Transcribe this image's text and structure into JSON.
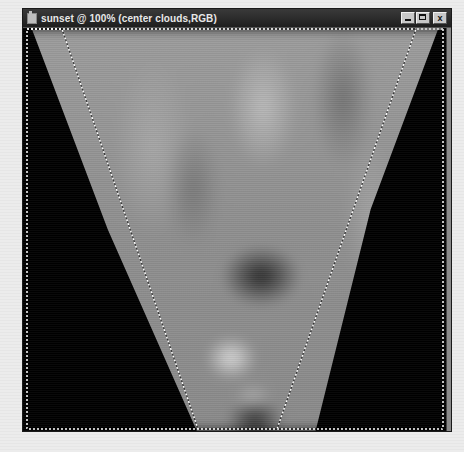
{
  "window": {
    "title": "sunset @ 100% (center clouds,RGB)",
    "document_name": "sunset",
    "zoom_level": "100%",
    "layer_name": "center clouds",
    "color_mode": "RGB",
    "controls": {
      "minimize_label": "",
      "maximize_label": "",
      "close_label": "x"
    }
  },
  "canvas": {
    "content": "grayscale clouds gradient in inverted trapezoid",
    "selection": {
      "type": "polygonal-marquee",
      "shape": "inverted trapezoid"
    }
  },
  "colors": {
    "background": "#ebebeb",
    "title_bar": "#2a2a2a",
    "title_text": "#e8e8e8",
    "canvas_bg": "#000000",
    "marquee": "#ffffff"
  },
  "icons": {
    "app_icon": "photoshop-document-icon",
    "minimize": "minimize-icon",
    "maximize": "maximize-icon",
    "close": "close-icon"
  }
}
